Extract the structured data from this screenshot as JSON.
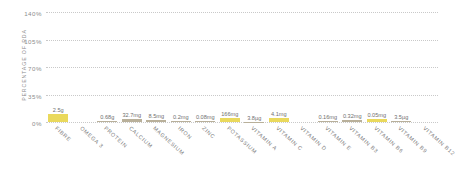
{
  "chart_data": {
    "type": "bar",
    "title": "",
    "subtitle": "",
    "xlabel": "",
    "ylabel": "PERCENTAGE OF RDA",
    "ylim": [
      0,
      140
    ],
    "yticks": [
      "0%",
      "35%",
      "70%",
      "105%",
      "140%"
    ],
    "ytick_values": [
      0,
      35,
      70,
      105,
      140
    ],
    "grid": true,
    "grid_style": "dotted-horizontal",
    "legend": "none",
    "categories": [
      "FIBRE",
      "OMEGA 3",
      "PROTEIN",
      "CALCIUM",
      "MAGNESIUM",
      "IRON",
      "ZINC",
      "POTASSIUM",
      "VITAMIN A",
      "VITAMIN C",
      "VITAMIN D",
      "VITAMIN E",
      "VITAMIN B3",
      "VITAMIN B6",
      "VITAMIN B9",
      "VITAMIN B12"
    ],
    "values": [
      10,
      0,
      1.4,
      4.1,
      2.3,
      1.5,
      0.8,
      4.7,
      0.5,
      5.1,
      0,
      1.4,
      2.1,
      3.6,
      1.8,
      0
    ],
    "data_labels": [
      "2.5g",
      "",
      "0.68g",
      "32.7mg",
      "8.5mg",
      "0.2mg",
      "0.08mg",
      "166mg",
      "3.8µg",
      "4.1mg",
      "",
      "0.16mg",
      "0.32mg",
      "0.05mg",
      "3.5µg",
      ""
    ],
    "bar_colors": [
      "#ead95c",
      "none",
      "#b9b09a",
      "#b9b09a",
      "#b9b09a",
      "#b9b09a",
      "#b9b09a",
      "#ead95c",
      "#b9b09a",
      "#ead95c",
      "none",
      "#b9b09a",
      "#b9b09a",
      "#ead95c",
      "#b9b09a",
      "none"
    ],
    "colors": {
      "highlight": "#ead95c",
      "muted": "#b9b09a",
      "gridline": "#c9c9c9",
      "axis_text": "#8a8a8a",
      "value_text": "#6f6f6f",
      "background": "#ffffff"
    }
  }
}
